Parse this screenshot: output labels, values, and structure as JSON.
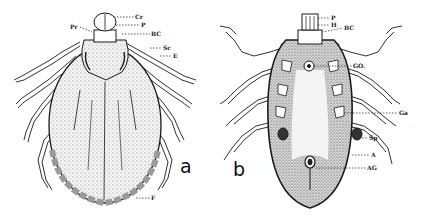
{
  "figure": {
    "panels": [
      {
        "id": "a",
        "letter": "a",
        "view": "dorsal",
        "labels": {
          "Cr": "Cr",
          "P": "P",
          "Pr": "Pr",
          "BC": "BC",
          "Sc": "Sc",
          "E": "E",
          "F": "F"
        }
      },
      {
        "id": "b",
        "letter": "b",
        "view": "ventral",
        "labels": {
          "P": "P",
          "H": "H",
          "BC": "BC",
          "GO": "GO.",
          "Ga": "Ga",
          "Sp": "Sp",
          "A": "A",
          "AG": "AG"
        }
      }
    ],
    "colors": {
      "ink": "#1a1a1a",
      "stipple": "#8a8a8a",
      "background": "#ffffff"
    }
  }
}
